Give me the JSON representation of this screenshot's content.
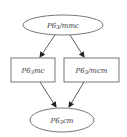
{
  "diagram": {
    "type": "directed-graph",
    "nodes": [
      {
        "id": "top",
        "shape": "ellipse",
        "label_main": "P6",
        "label_sub": "3",
        "label_rest": "/mmc",
        "full_label": "P6₃/mmc"
      },
      {
        "id": "left",
        "shape": "box",
        "label_main": "P6",
        "label_sub": "3",
        "label_rest": "mc",
        "full_label": "P6₃mc"
      },
      {
        "id": "right",
        "shape": "box",
        "label_main": "P6",
        "label_sub": "3",
        "label_rest": "/mcm",
        "full_label": "P6₃/mcm"
      },
      {
        "id": "bottom",
        "shape": "ellipse",
        "label_main": "P6",
        "label_sub": "3",
        "label_rest": "cm",
        "full_label": "P6₃cm"
      }
    ],
    "edges": [
      {
        "from": "P6₃/mmc",
        "to": "P6₃mc"
      },
      {
        "from": "P6₃/mmc",
        "to": "P6₃/mcm"
      },
      {
        "from": "P6₃mc",
        "to": "P6₃cm"
      },
      {
        "from": "P6₃/mcm",
        "to": "P6₃cm"
      }
    ],
    "colors": {
      "stroke": "#555555",
      "edge": "#333333",
      "text": "#333333",
      "background": "#ffffff"
    }
  }
}
